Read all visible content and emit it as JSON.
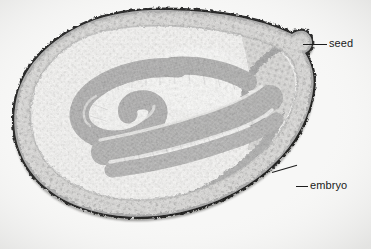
{
  "figure": {
    "kind": "light-micrograph",
    "width_px": 371,
    "height_px": 249,
    "background_color": "#f7f7f6",
    "ink_color": "#1c1c1c",
    "watermark_text": ""
  },
  "annotations": [
    {
      "id": "seed",
      "label": "seed",
      "leader": "horizontal",
      "points_to": "outer seed coat at upper right"
    },
    {
      "id": "embryo",
      "label": "embryo",
      "leader": "elbow",
      "points_to": "embryo cotyledon at lower right"
    }
  ],
  "specimen": {
    "structures": [
      {
        "name": "seed-coat-outer-papillae",
        "tone": "#6f6f6f"
      },
      {
        "name": "seed-coat-dark-layer",
        "tone": "#1f1f1f"
      },
      {
        "name": "seed-coat-parenchyma",
        "tone": "#9a9a9a"
      },
      {
        "name": "endosperm-cavity",
        "tone": "#f0efec"
      },
      {
        "name": "embryo-cotyledon",
        "tone": "#3a3a3a"
      },
      {
        "name": "embryo-radicle",
        "tone": "#2e2e2e"
      }
    ]
  }
}
